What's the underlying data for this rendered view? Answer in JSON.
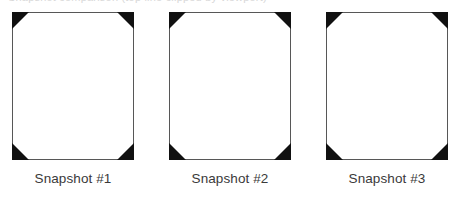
{
  "page": {
    "background_color": "#ffffff",
    "clipped_header_text": "Snapshot comparison (top line clipped by viewport)"
  },
  "figure": {
    "frame_border_color": "#575757",
    "corner_marker_color": "#111111",
    "caption_color": "#3a3a3a",
    "frames": [
      {
        "caption": "Snapshot #1",
        "corners": [
          "top-left",
          "top-right",
          "bottom-left",
          "bottom-right"
        ],
        "content": ""
      },
      {
        "caption": "Snapshot #2",
        "corners": [
          "top-left",
          "top-right",
          "bottom-left",
          "bottom-right"
        ],
        "content": ""
      },
      {
        "caption": "Snapshot #3",
        "corners": [
          "top-left",
          "top-right",
          "bottom-left",
          "bottom-right"
        ],
        "content": ""
      }
    ]
  }
}
